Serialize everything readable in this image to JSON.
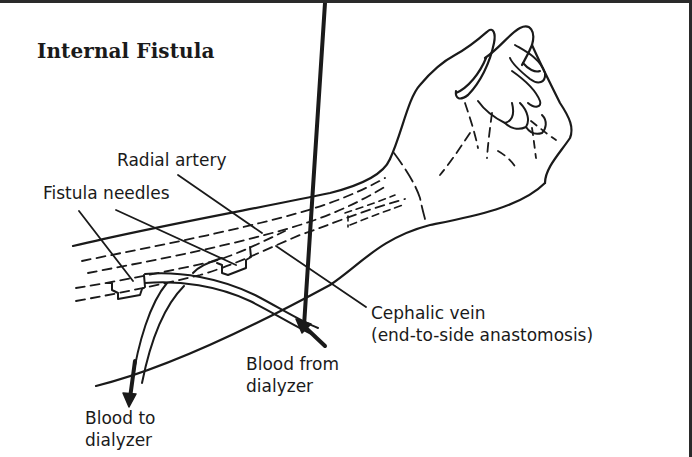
{
  "diagram": {
    "title": "Internal Fistula",
    "labels": {
      "radial_artery": "Radial artery",
      "fistula_needles": "Fistula needles",
      "cephalic_vein_line1": "Cephalic vein",
      "cephalic_vein_line2": "(end-to-side anastomosis)",
      "blood_from_line1": "Blood from",
      "blood_from_line2": "dialyzer",
      "blood_to_line1": "Blood to",
      "blood_to_line2": "dialyzer"
    },
    "colors": {
      "line": "#1a1a1a",
      "background": "#ffffff",
      "frame": "#2a2a2a"
    }
  }
}
